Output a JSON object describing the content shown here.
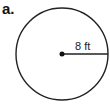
{
  "figure": {
    "label": "a.",
    "shape": "circle",
    "radius_label": "8 ft",
    "circle": {
      "cx": 62,
      "cy": 54,
      "r": 46,
      "stroke": "#222222"
    },
    "center_point": {
      "cx": 62,
      "cy": 54,
      "r": 2.5,
      "fill": "#111111"
    },
    "radius_line": {
      "x1": 62,
      "y1": 54,
      "x2": 108,
      "y2": 54
    }
  }
}
